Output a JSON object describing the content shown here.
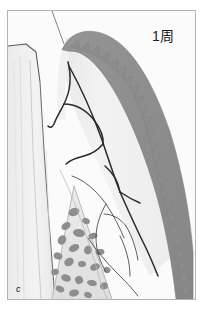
{
  "figure": {
    "panel_label": "c",
    "timepoint_label": "1周",
    "frame": {
      "x": 7,
      "y": 10,
      "width": 189,
      "height": 290,
      "border_color": "#b4b4b4",
      "background_color": "#fbfbfb"
    },
    "colors": {
      "gingiva_band": "#8c8c8c",
      "gingiva_band_edge": "#777777",
      "connective_tissue": "#efefef",
      "connective_tissue_light": "#f4f4f4",
      "tooth": "#f0f0f0",
      "tooth_outline": "#555555",
      "bone_matrix": "#e2e2e2",
      "bone_trabecula": "#8e8e8e",
      "vessel_line": "#2a2a2a",
      "thin_line": "#444444",
      "text": "#1a1a1a",
      "page_background": "#ffffff"
    },
    "regions": [
      {
        "name": "gingival-epithelium-band",
        "fill": "#8c8c8c",
        "description": "dark grey marginal gingiva with sawtooth rete-peg inner border"
      },
      {
        "name": "connective-tissue-core",
        "fill": "#efefef",
        "description": "pale lamina propria containing vessel tracings"
      },
      {
        "name": "tooth-crown-root",
        "fill": "#f0f0f0",
        "description": "tooth profile at left of section"
      },
      {
        "name": "alveolar-bone-marrow",
        "fill": "#e2e2e2",
        "description": "wedge of trabecular bone at base of section"
      }
    ],
    "features": {
      "sawtooth_teeth_count": 26,
      "bone_trabecula_count": 22,
      "vessel_branch_count": 8
    }
  }
}
